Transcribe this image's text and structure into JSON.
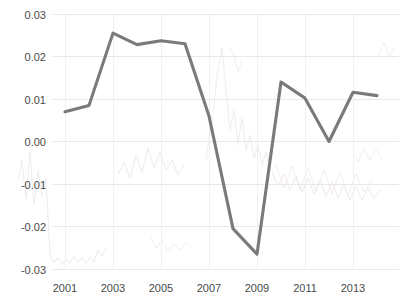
{
  "chart_data": {
    "type": "line",
    "title": "",
    "subtitle": "",
    "xlabel": "",
    "ylabel": "",
    "x": [
      2001,
      2002,
      2003,
      2004,
      2005,
      2006,
      2007,
      2008,
      2009,
      2010,
      2011,
      2012,
      2013,
      2014
    ],
    "values": [
      0.007,
      0.0085,
      0.0255,
      0.0228,
      0.0237,
      0.023,
      0.006,
      -0.0205,
      -0.0265,
      0.014,
      0.0102,
      0.0,
      0.0116,
      0.0108
    ],
    "series": [
      {
        "name": "series-1",
        "color": "#7a7a7a",
        "values": [
          0.007,
          0.0085,
          0.0255,
          0.0228,
          0.0237,
          0.023,
          0.006,
          -0.0205,
          -0.0265,
          0.014,
          0.0102,
          0.0,
          0.0116,
          0.0108
        ]
      }
    ],
    "xlim": [
      2000.5,
      2014.5
    ],
    "ylim": [
      -0.03,
      0.03
    ],
    "ytick_labels": [
      "0.03",
      "0.02",
      "0.01",
      "0.00",
      "-0.01",
      "-0.02",
      "-0.03"
    ],
    "ytick_values": [
      0.03,
      0.02,
      0.01,
      0.0,
      -0.01,
      -0.02,
      -0.03
    ],
    "xtick_labels": [
      "2001",
      "2003",
      "2005",
      "2007",
      "2009",
      "2011",
      "2013"
    ],
    "xtick_values": [
      2001,
      2003,
      2005,
      2007,
      2009,
      2011,
      2013
    ],
    "grid": true,
    "grid_color": "#e8e8e8",
    "legend": false,
    "legend_position": "none",
    "background_color": "#ffffff",
    "line_color": "#7a7a7a",
    "tick_label_color": "#4a4a4a"
  },
  "axes": {
    "y_ticks": [
      {
        "label": "0.03",
        "value": 0.03
      },
      {
        "label": "0.02",
        "value": 0.02
      },
      {
        "label": "0.01",
        "value": 0.01
      },
      {
        "label": "0.00",
        "value": 0.0
      },
      {
        "label": "-0.01",
        "value": -0.01
      },
      {
        "label": "-0.02",
        "value": -0.02
      },
      {
        "label": "-0.03",
        "value": -0.03
      }
    ],
    "x_ticks": [
      {
        "label": "2001",
        "value": 2001
      },
      {
        "label": "2003",
        "value": 2003
      },
      {
        "label": "2005",
        "value": 2005
      },
      {
        "label": "2007",
        "value": 2007
      },
      {
        "label": "2009",
        "value": 2009
      },
      {
        "label": "2011",
        "value": 2011
      },
      {
        "label": "2013",
        "value": 2013
      }
    ]
  }
}
